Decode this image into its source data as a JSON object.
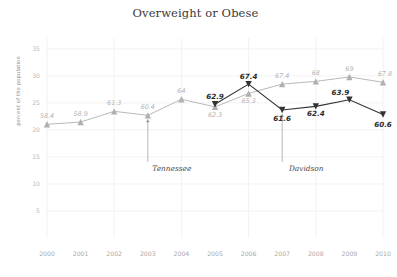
{
  "chart_data": {
    "type": "line",
    "title": "Overweight or Obese",
    "xlabel": "",
    "ylabel": "percent of the population",
    "categories": [
      "2000",
      "2001",
      "2002",
      "2003",
      "2004",
      "2005",
      "2006",
      "2007",
      "2008",
      "2009",
      "2010"
    ],
    "x": [
      2000,
      2001,
      2002,
      2003,
      2004,
      2005,
      2006,
      2007,
      2008,
      2009,
      2010
    ],
    "ylim": [
      0,
      37
    ],
    "yticks": [
      5,
      10,
      15,
      20,
      25,
      30,
      35
    ],
    "ytick_labels": [
      "5",
      "10",
      "15",
      "20",
      "25",
      "30",
      "35"
    ],
    "grid": true,
    "legend_position": "inline-annotation",
    "series": [
      {
        "name": "Tennessee",
        "color": "#b0b0b0",
        "marker": "triangle-up",
        "values": [
          58.4,
          58.9,
          61.3,
          60.4,
          64,
          62.3,
          65.3,
          67.4,
          68,
          69,
          67.8
        ],
        "labels": [
          "58.4",
          "58.9",
          "61.3",
          "60.4",
          "64",
          "62.3",
          "65.3",
          "67.4",
          "68",
          "69",
          "67.8"
        ]
      },
      {
        "name": "Davidson",
        "color": "#333333",
        "marker": "triangle-down",
        "values": [
          null,
          null,
          null,
          null,
          null,
          62.9,
          67.4,
          61.6,
          62.4,
          63.9,
          60.6
        ],
        "labels": [
          "",
          "",
          "",
          "",
          "",
          "62.9",
          "67.4",
          "61.6",
          "62.4",
          "63.9",
          "60.6"
        ]
      }
    ],
    "annotations": [
      {
        "text": "Tennessee",
        "series": "Tennessee",
        "leader_x_year": 2003
      },
      {
        "text": "Davidson",
        "series": "Davidson",
        "leader_x_year": 2007
      }
    ]
  }
}
